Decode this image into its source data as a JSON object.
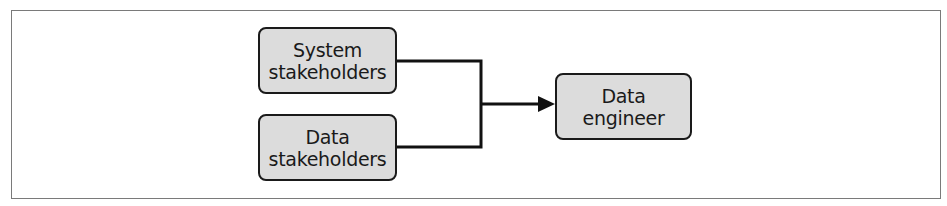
{
  "diagram": {
    "type": "flow",
    "nodes": [
      {
        "id": "system-stakeholders",
        "lines": [
          "System",
          "stakeholders"
        ]
      },
      {
        "id": "data-stakeholders",
        "lines": [
          "Data",
          "stakeholders"
        ]
      },
      {
        "id": "data-engineer",
        "lines": [
          "Data",
          "engineer"
        ]
      }
    ],
    "edges": [
      {
        "from": "system-stakeholders",
        "to": "data-engineer"
      },
      {
        "from": "data-stakeholders",
        "to": "data-engineer"
      }
    ],
    "colors": {
      "node_fill": "#dcdcdc",
      "node_border": "#1a1a1a",
      "line": "#111111",
      "frame": "#7a7a7a"
    }
  }
}
